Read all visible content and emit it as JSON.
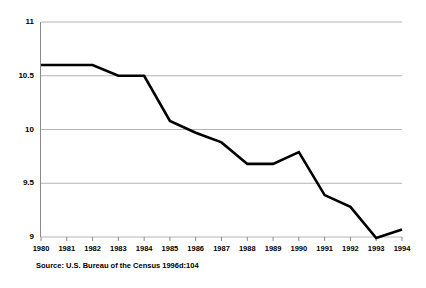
{
  "chart_data": {
    "type": "line",
    "title": "",
    "subtitle": "",
    "xlabel": "",
    "ylabel": "",
    "x": [
      1980,
      1981,
      1982,
      1983,
      1984,
      1985,
      1986,
      1987,
      1988,
      1989,
      1990,
      1991,
      1992,
      1993,
      1994
    ],
    "categories": [
      "1980",
      "1981",
      "1982",
      "1983",
      "1984",
      "1985",
      "1986",
      "1987",
      "1988",
      "1989",
      "1990",
      "1991",
      "1992",
      "1993",
      "1994"
    ],
    "values": [
      10.6,
      10.6,
      10.6,
      10.5,
      10.5,
      10.08,
      9.97,
      9.88,
      9.68,
      9.68,
      9.79,
      9.39,
      9.28,
      8.99,
      9.07
    ],
    "series": [
      {
        "name": "",
        "values": [
          10.6,
          10.6,
          10.6,
          10.5,
          10.5,
          10.08,
          9.97,
          9.88,
          9.68,
          9.68,
          9.79,
          9.39,
          9.28,
          8.99,
          9.07
        ]
      }
    ],
    "xlim": [
      1980,
      1994
    ],
    "ylim": [
      9,
      11
    ],
    "ytick_values": [
      11,
      10.5,
      10,
      9.5,
      9
    ],
    "ytick_labels": [
      "11",
      "10.5",
      "10",
      "9.5",
      "9"
    ],
    "grid": true,
    "grid_axis": "y",
    "legend": "none",
    "line_color": "#000000",
    "line_width": 2.6,
    "grid_color": "#b5b5b5",
    "axis_color": "#8a8a8a",
    "background_color": "#ffffff"
  },
  "source": {
    "text": "Source: U.S. Bureau of the Census 1996d:104"
  }
}
